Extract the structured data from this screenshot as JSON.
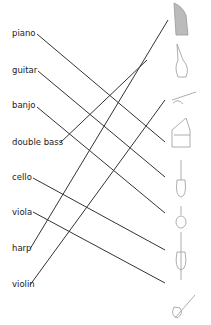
{
  "labels": [
    {
      "text": "piano",
      "x": 12,
      "y": 28
    },
    {
      "text": "guitar",
      "x": 12,
      "y": 65
    },
    {
      "text": "banjo",
      "x": 12,
      "y": 100
    },
    {
      "text": "double bass",
      "x": 12,
      "y": 137
    },
    {
      "text": "cello",
      "x": 12,
      "y": 172
    },
    {
      "text": "viola",
      "x": 12,
      "y": 207
    },
    {
      "text": "harp",
      "x": 12,
      "y": 243
    },
    {
      "text": "violin",
      "x": 12,
      "y": 279
    }
  ],
  "icons": [
    "harp-icon",
    "double-bass-icon",
    "banjo-icon",
    "piano-icon",
    "guitar-icon",
    "viola-icon",
    "cello-icon",
    "violin-icon"
  ],
  "lines": [
    [
      37,
      34,
      165,
      142
    ],
    [
      38,
      71,
      165,
      177
    ],
    [
      37,
      107,
      165,
      213
    ],
    [
      60,
      143,
      147,
      60
    ],
    [
      33,
      178,
      165,
      250
    ],
    [
      33,
      212,
      165,
      283
    ],
    [
      30,
      249,
      168,
      20
    ],
    [
      30,
      285,
      165,
      100
    ]
  ],
  "line_color": "#333333"
}
